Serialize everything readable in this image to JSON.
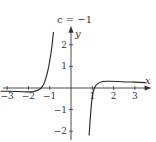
{
  "chart_data": {
    "type": "line",
    "title": "c = −1",
    "xlabel": "x",
    "ylabel": "y",
    "xlim": [
      -3.3,
      3.5
    ],
    "ylim": [
      -2.2,
      2.6
    ],
    "grid": false,
    "x_ticks": [
      -3,
      -2,
      -1,
      1,
      2,
      3
    ],
    "x_tick_labels": [
      "−3",
      "−2",
      "−1",
      "1",
      "2",
      "3"
    ],
    "y_ticks": [
      -2,
      -1,
      1,
      2
    ],
    "y_tick_labels": [
      "−2",
      "−1",
      "1",
      "2"
    ],
    "series": [
      {
        "name": "left-branch",
        "points": [
          [
            -3.3,
            -0.15
          ],
          [
            -3.0,
            -0.15
          ],
          [
            -2.5,
            -0.16
          ],
          [
            -2.0,
            -0.18
          ],
          [
            -1.8,
            -0.17
          ],
          [
            -1.6,
            -0.12
          ],
          [
            -1.4,
            0.0
          ],
          [
            -1.25,
            0.25
          ],
          [
            -1.1,
            0.75
          ],
          [
            -1.0,
            1.25
          ],
          [
            -0.9,
            1.9
          ],
          [
            -0.82,
            2.6
          ]
        ]
      },
      {
        "name": "right-branch",
        "points": [
          [
            0.85,
            -2.2
          ],
          [
            0.92,
            -1.2
          ],
          [
            1.0,
            -0.4
          ],
          [
            1.1,
            0.0
          ],
          [
            1.25,
            0.2
          ],
          [
            1.5,
            0.3
          ],
          [
            1.8,
            0.31
          ],
          [
            2.2,
            0.3
          ],
          [
            2.6,
            0.28
          ],
          [
            3.0,
            0.27
          ],
          [
            3.5,
            0.25
          ]
        ]
      }
    ]
  }
}
